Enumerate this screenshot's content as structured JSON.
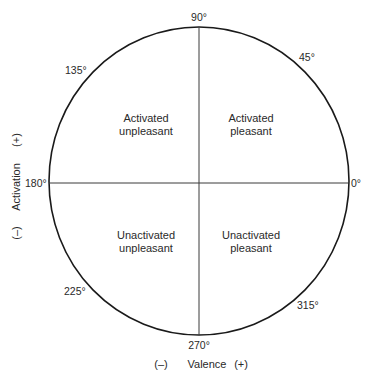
{
  "diagram": {
    "type": "circumplex",
    "title": "",
    "axes": {
      "horizontal": {
        "label": "Valence",
        "negative": "(–)",
        "positive": "(+)"
      },
      "vertical": {
        "label": "Activation",
        "negative": "(–)",
        "positive": "(+)"
      }
    },
    "angle_labels": {
      "a0": "0°",
      "a45": "45°",
      "a90": "90°",
      "a135": "135°",
      "a180": "180°",
      "a225": "225°",
      "a270": "270°",
      "a315": "315°"
    },
    "quadrants": {
      "top_left": {
        "line1": "Activated",
        "line2": "unpleasant"
      },
      "top_right": {
        "line1": "Activated",
        "line2": "pleasant"
      },
      "bottom_left": {
        "line1": "Unactivated",
        "line2": "unpleasant"
      },
      "bottom_right": {
        "line1": "Unactivated",
        "line2": "pleasant"
      }
    },
    "colors": {
      "stroke": "#1a1a1a",
      "text": "#2a2a2a",
      "background": "#ffffff"
    }
  }
}
